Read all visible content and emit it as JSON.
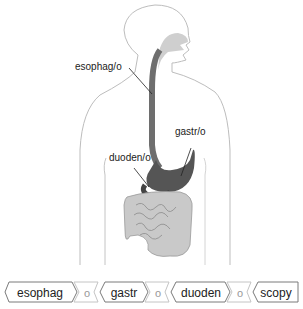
{
  "diagram": {
    "labels": {
      "esophagus": "esophag/o",
      "stomach": "gastr/o",
      "duodenum": "duoden/o"
    }
  },
  "word_parts": {
    "parts": [
      {
        "text": "esophag",
        "type": "root"
      },
      {
        "text": "o",
        "type": "combining-vowel"
      },
      {
        "text": "gastr",
        "type": "root"
      },
      {
        "text": "o",
        "type": "combining-vowel"
      },
      {
        "text": "duoden",
        "type": "root"
      },
      {
        "text": "o",
        "type": "combining-vowel"
      },
      {
        "text": "scopy",
        "type": "suffix"
      }
    ]
  },
  "colors": {
    "outline": "#b5b5b5",
    "organ_dark": "#5a5a5a",
    "organ_light": "#c8c8c8",
    "chip_border": "#777777",
    "vowel_border": "#bdbdbd"
  }
}
